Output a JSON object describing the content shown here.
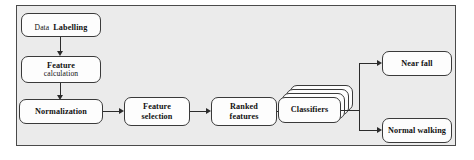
{
  "figure": {
    "type": "flowchart",
    "panel": {
      "background_color": "#ebebeb",
      "border_color": "#4a4a4a"
    },
    "node_style": {
      "fill_color": "#fdfdfd",
      "border_color": "#3a3a3a",
      "shape": "rounded-rectangle"
    },
    "connector_color": "#2b2b2b"
  },
  "nodes": {
    "data_labelling": {
      "line1": "Data",
      "line2": "Labelling"
    },
    "feature_calculation": {
      "line1": "Feature",
      "line2": "calculation"
    },
    "normalization": {
      "line1": "Normalization"
    },
    "feature_selection": {
      "line1": "Feature",
      "line2": "selection"
    },
    "ranked_features": {
      "line1": "Ranked",
      "line2": "features"
    },
    "classifiers": {
      "line1": "Classifiers",
      "stack_count": 4
    },
    "near_fall": {
      "line1": "Near fall"
    },
    "normal_walking": {
      "line1": "Normal walking"
    }
  },
  "flow": {
    "edges": [
      {
        "from": "data_labelling",
        "to": "feature_calculation",
        "direction": "down"
      },
      {
        "from": "feature_calculation",
        "to": "normalization",
        "direction": "down"
      },
      {
        "from": "normalization",
        "to": "feature_selection",
        "direction": "right"
      },
      {
        "from": "feature_selection",
        "to": "ranked_features",
        "direction": "right"
      },
      {
        "from": "ranked_features",
        "to": "classifiers",
        "direction": "right"
      },
      {
        "from": "classifiers",
        "to": "near_fall",
        "direction": "branch-up"
      },
      {
        "from": "classifiers",
        "to": "normal_walking",
        "direction": "branch-down"
      }
    ]
  }
}
